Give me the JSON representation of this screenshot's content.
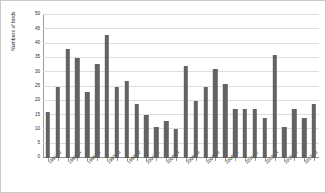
{
  "chart_data": {
    "type": "bar",
    "title": "",
    "xlabel": "",
    "ylabel": "Numbers of birds",
    "ylim": [
      0,
      50
    ],
    "ytick_step": 5,
    "yticks": [
      0,
      5,
      10,
      15,
      20,
      25,
      30,
      35,
      40,
      45,
      50
    ],
    "grid": true,
    "legend": "none",
    "bar_color": "#636363",
    "gridline_color": "#dedede",
    "categories": [
      "1991/92",
      "1992/93",
      "1993/94",
      "1994/95",
      "1995/96",
      "1996/97",
      "1997/98",
      "1998/99",
      "1999/00",
      "2000/01",
      "2001/02",
      "2002/03",
      "2003/04",
      "2004/05",
      "2005/06",
      "2006/07",
      "2007/08",
      "2008/09",
      "2009/10",
      "2010/11",
      "2011/12",
      "2012/13",
      "2013/14",
      "2014/15",
      "2015/16",
      "2016/17",
      "2017/18",
      "2018/19"
    ],
    "tick_labels_shown": [
      "1991/92",
      "1993/94",
      "1995/96",
      "1997/98",
      "1999/00",
      "2001/02",
      "2003/04",
      "2005/06",
      "2007/08",
      "2009/10",
      "2011/12",
      "2013/14",
      "2015/16",
      "2017/18"
    ],
    "values": [
      16,
      25,
      38,
      35,
      23,
      33,
      43,
      25,
      27,
      19,
      15,
      11,
      13,
      10,
      32,
      20,
      25,
      31,
      26,
      17,
      17,
      17,
      14,
      36,
      11,
      17,
      14,
      19
    ]
  }
}
